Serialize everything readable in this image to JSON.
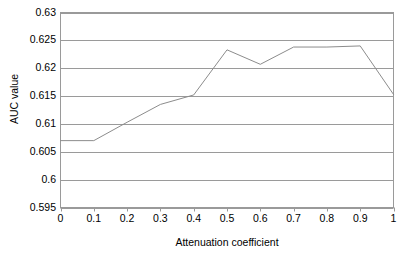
{
  "chart_data": {
    "type": "line",
    "title": "",
    "xlabel": "Attenuation coefficient",
    "ylabel": "AUC value",
    "x": [
      0,
      0.1,
      0.2,
      0.3,
      0.4,
      0.5,
      0.6,
      0.7,
      0.8,
      0.9,
      1
    ],
    "values": [
      0.607,
      0.607,
      0.6103,
      0.6135,
      0.6152,
      0.6233,
      0.6207,
      0.6238,
      0.6238,
      0.624,
      0.6153
    ],
    "series": [
      {
        "name": "AUC value",
        "values": [
          0.607,
          0.607,
          0.6103,
          0.6135,
          0.6152,
          0.6233,
          0.6207,
          0.6238,
          0.6238,
          0.624,
          0.6153
        ]
      }
    ],
    "xlim": [
      0,
      1
    ],
    "ylim": [
      0.595,
      0.63
    ],
    "xticks": [
      0,
      0.1,
      0.2,
      0.3,
      0.4,
      0.5,
      0.6,
      0.7,
      0.8,
      0.9,
      1
    ],
    "xtick_labels": [
      "0",
      "0.1",
      "0.2",
      "0.3",
      "0.4",
      "0.5",
      "0.6",
      "0.7",
      "0.8",
      "0.9",
      "1"
    ],
    "yticks": [
      0.595,
      0.6,
      0.605,
      0.61,
      0.615,
      0.62,
      0.625,
      0.63
    ],
    "ytick_labels": [
      "0.595",
      "0.6",
      "0.605",
      "0.61",
      "0.615",
      "0.62",
      "0.625",
      "0.63"
    ],
    "grid": "horizontal",
    "legend": "none",
    "line_color": "#8c8c8c",
    "frame_color": "#9a9a9a",
    "background_color": "#ffffff",
    "text_color": "#000000"
  }
}
